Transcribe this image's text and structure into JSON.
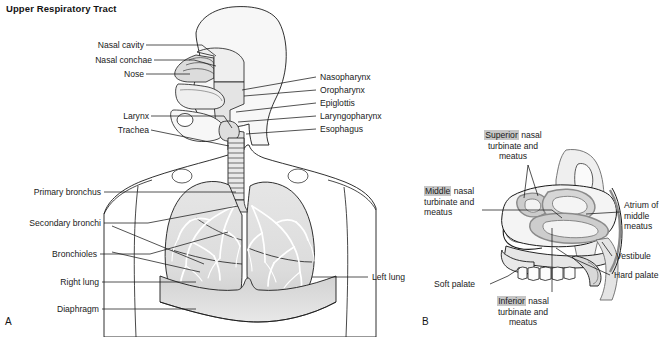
{
  "figure": {
    "title": "Upper Respiratory Tract",
    "panels": [
      {
        "id": "A",
        "letter": "A"
      },
      {
        "id": "B",
        "letter": "B"
      }
    ]
  },
  "panel_a": {
    "letter": "A",
    "labels_left": [
      {
        "text": "Nasal cavity",
        "x": 88,
        "y": 41
      },
      {
        "text": "Nasal conchae",
        "x": 83,
        "y": 56
      },
      {
        "text": "Nose",
        "x": 120,
        "y": 70
      },
      {
        "text": "Larynx",
        "x": 112,
        "y": 112
      },
      {
        "text": "Trachea",
        "x": 105,
        "y": 126
      },
      {
        "text": "Primary bronchus",
        "x": 11,
        "y": 188
      },
      {
        "text": "Secondary bronchi",
        "x": 6,
        "y": 219
      },
      {
        "text": "Bronchioles",
        "x": 34,
        "y": 250
      },
      {
        "text": "Right lung",
        "x": 41,
        "y": 278
      },
      {
        "text": "Diaphragm",
        "x": 36,
        "y": 305
      }
    ],
    "labels_right": [
      {
        "text": "Nasopharynx",
        "x": 322,
        "y": 73
      },
      {
        "text": "Oropharynx",
        "x": 322,
        "y": 86
      },
      {
        "text": "Epiglottis",
        "x": 322,
        "y": 99
      },
      {
        "text": "Laryngopharynx",
        "x": 322,
        "y": 112
      },
      {
        "text": "Esophagus",
        "x": 322,
        "y": 125
      },
      {
        "text": "Left lung",
        "x": 385,
        "y": 273
      }
    ]
  },
  "panel_b": {
    "letter": "B",
    "labels": [
      {
        "name": "superior-nasal-turbinate",
        "highlight": "Superior",
        "rest": " nasal",
        "line2": "turbinate and",
        "line3": "meatus",
        "x": 498,
        "y": 131,
        "align": "center"
      },
      {
        "name": "middle-nasal-turbinate",
        "highlight": "Middle",
        "rest": " nasal",
        "line2": "turbinate and",
        "line3": "meatus",
        "x": 424,
        "y": 188,
        "align": "left"
      },
      {
        "name": "inferior-nasal-turbinate",
        "highlight": "Inferior",
        "rest": " nasal",
        "line2": "turbinate and",
        "line3": "meatus",
        "x": 508,
        "y": 297,
        "align": "center"
      },
      {
        "name": "atrium-of-middle-meatus",
        "line1": "Atrium of",
        "line2": "middle",
        "line3": "meatus",
        "x": 625,
        "y": 206,
        "align": "left"
      },
      {
        "name": "vestibule",
        "line1": "Vestibule",
        "x": 617,
        "y": 256,
        "align": "left"
      },
      {
        "name": "hard-palate",
        "line1": "Hard palate",
        "x": 616,
        "y": 275,
        "align": "left"
      },
      {
        "name": "soft-palate",
        "line1": "Soft palate",
        "x": 436,
        "y": 283,
        "align": "left"
      }
    ]
  },
  "colors": {
    "outline": "#1a1a1a",
    "tissue_light": "#f2f2f2",
    "tissue_mid": "#e2e2e2",
    "tissue_dark": "#c9c9c9",
    "mucosa": "#9e9e9e",
    "highlight_bg": "#c6c6c6",
    "background": "#ffffff"
  }
}
